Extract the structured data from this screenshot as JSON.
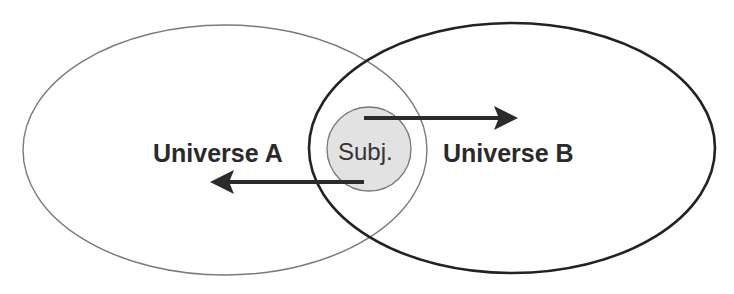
{
  "diagram": {
    "universe_a": {
      "label": "Universe A",
      "stroke": "#777777"
    },
    "universe_b": {
      "label": "Universe B",
      "stroke": "#222222"
    },
    "subject": {
      "label": "Subj.",
      "fill": "#e2e2e2",
      "stroke": "#777777"
    },
    "arrows": [
      {
        "direction": "right",
        "from": "subject",
        "to": "universe_b"
      },
      {
        "direction": "left",
        "from": "subject",
        "to": "universe_a"
      }
    ],
    "arrow_color": "#2b2b2b"
  }
}
